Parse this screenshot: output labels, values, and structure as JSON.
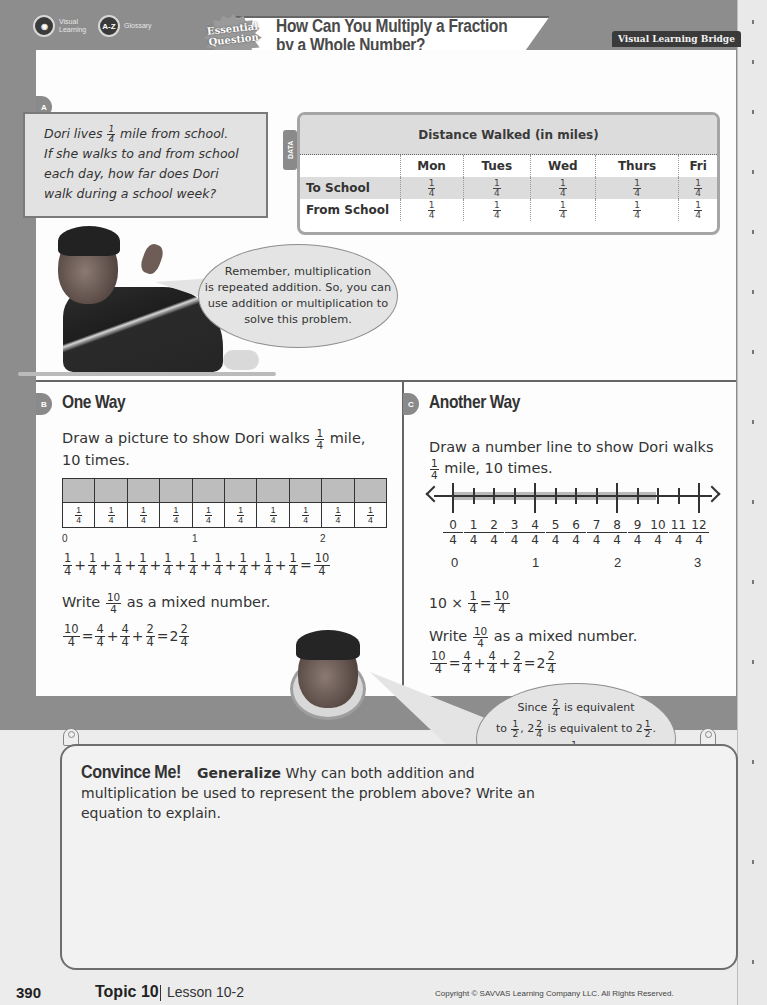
{
  "header": {
    "tools": [
      {
        "icon": "eye-icon",
        "label_line1": "Visual",
        "label_line2": "Learning"
      },
      {
        "icon": "a-z-icon",
        "glyph": "A-Z",
        "label": "Glossary"
      }
    ],
    "badge_line1": "Essential",
    "badge_line2": "Question",
    "title_line1": "How Can You Multiply a Fraction",
    "title_line2": "by a Whole Number?",
    "section_label": "Visual Learning Bridge"
  },
  "section_a": {
    "tag": "A",
    "problem": {
      "text_before_frac": "Dori lives ",
      "frac": {
        "n": "1",
        "d": "4"
      },
      "line1_after": " mile from school.",
      "line2": "If she walks to and from school",
      "line3": "each day, how far does Dori",
      "line4": "walk during a school week?"
    },
    "data_tag": "DATA",
    "table": {
      "title": "Distance Walked (in miles)",
      "columns": [
        "",
        "Mon",
        "Tues",
        "Wed",
        "Thurs",
        "Fri"
      ],
      "rows": [
        {
          "label": "To School",
          "values": [
            "1/4",
            "1/4",
            "1/4",
            "1/4",
            "1/4"
          ]
        },
        {
          "label": "From School",
          "values": [
            "1/4",
            "1/4",
            "1/4",
            "1/4",
            "1/4"
          ]
        }
      ],
      "frac_n": "1",
      "frac_d": "4"
    },
    "bubble": {
      "line1": "Remember, multiplication",
      "line2": "is repeated addition. So, you can",
      "line3": "use addition or multiplication to",
      "line4": "solve this problem."
    }
  },
  "section_b": {
    "tag": "B",
    "title": "One Way",
    "instr_before": "Draw a picture to show Dori walks ",
    "instr_after": " mile,",
    "instr_line2": "10 times.",
    "bar_cells": 10,
    "bar_cell_n": "1",
    "bar_cell_d": "4",
    "bar_labels": [
      "0",
      "1",
      "2"
    ],
    "sum_equation": {
      "terms": 10,
      "n": "1",
      "d": "4",
      "result_n": "10",
      "result_d": "4"
    },
    "write_before": "Write ",
    "write_frac": {
      "n": "10",
      "d": "4"
    },
    "write_after": " as a mixed number.",
    "mixed": {
      "lhs_n": "10",
      "lhs_d": "4",
      "a_n": "4",
      "a_d": "4",
      "b_n": "4",
      "b_d": "4",
      "c_n": "2",
      "c_d": "4",
      "whole": "2",
      "res_n": "2",
      "res_d": "4"
    }
  },
  "section_c": {
    "tag": "C",
    "title": "Another Way",
    "instr_line1": "Draw a number line to show Dori walks",
    "instr_after": " mile, 10 times.",
    "frac": {
      "n": "1",
      "d": "4"
    },
    "number_line": {
      "ticks": [
        "0",
        "1",
        "2",
        "3",
        "4",
        "5",
        "6",
        "7",
        "8",
        "9",
        "10",
        "11",
        "12"
      ],
      "denominator": "4",
      "wholes": [
        "0",
        "1",
        "2",
        "3"
      ]
    },
    "mult": {
      "factor": "10 ×",
      "n": "1",
      "d": "4",
      "res_n": "10",
      "res_d": "4"
    },
    "write_before": "Write ",
    "write_frac": {
      "n": "10",
      "d": "4"
    },
    "write_after": " as a mixed number.",
    "mixed": {
      "lhs_n": "10",
      "lhs_d": "4",
      "a_n": "4",
      "a_d": "4",
      "b_n": "4",
      "b_d": "4",
      "c_n": "2",
      "c_d": "4",
      "whole": "2",
      "res_n": "2",
      "res_d": "4"
    }
  },
  "bubble2": {
    "l1_before": "Since ",
    "l1_frac": {
      "n": "2",
      "d": "4"
    },
    "l1_after": " is equivalent",
    "l2_to": "to ",
    "l2_frac1": {
      "n": "1",
      "d": "2"
    },
    "l2_mid_whole": ", 2",
    "l2_frac2": {
      "n": "2",
      "d": "4"
    },
    "l2_mid": " is equivalent to 2",
    "l2_frac3": {
      "n": "1",
      "d": "2"
    },
    "l2_end": ".",
    "l3_before": "Dori walks 2",
    "l3_frac": {
      "n": "1",
      "d": "2"
    },
    "l3_after": " miles to and",
    "l4": "from school each week."
  },
  "convince": {
    "title": "Convince Me!",
    "practice": "Generalize",
    "text": "Why can both addition and multiplication be used to represent the problem above? Write an equation to explain."
  },
  "footer": {
    "page": "390",
    "topic": "Topic 10",
    "lesson": "Lesson 10-2",
    "copyright": "Copyright © SAVVAS Learning Company LLC. All Rights Reserved."
  }
}
